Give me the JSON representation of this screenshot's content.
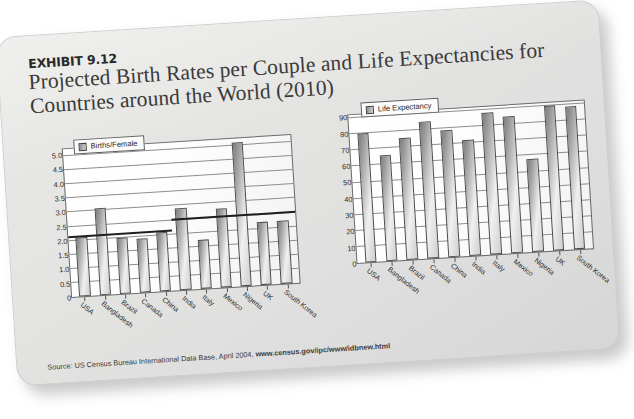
{
  "exhibit": {
    "label": "EXHIBIT 9.12",
    "title": "Projected Birth Rates per Couple and Life Expectancies for Countries around the World (2010)",
    "source_prefix": "Source: US Census Bureau International Data Base, April 2004,",
    "source_url": "www.census.gov/ipc/www/idbnew.html"
  },
  "chart_data": [
    {
      "type": "bar",
      "title": "",
      "legend": "Births/Female",
      "legend_position": "top-left-inside",
      "xlabel": "",
      "ylabel": "",
      "grid": true,
      "ylim": [
        0,
        5.25
      ],
      "yticks": [
        "0",
        "0.5",
        "1.0",
        "1.5",
        "2.0",
        "2.5",
        "3.0",
        "3.5",
        "4.0",
        "4.5",
        "5.0"
      ],
      "ytick_values": [
        0,
        0.5,
        1.0,
        1.5,
        2.0,
        2.5,
        3.0,
        3.5,
        4.0,
        4.5,
        5.0
      ],
      "reference_lines": [
        {
          "label": "left-segment",
          "value": 2.1,
          "from_index": 0,
          "to_index": 5
        },
        {
          "label": "right-segment",
          "value": 2.5,
          "from_index": 5,
          "to_index": 11
        }
      ],
      "categories": [
        "USA",
        "Bangladesh",
        "Brazil",
        "Canada",
        "China",
        "India",
        "Italy",
        "Mexico",
        "Nigeria",
        "UK",
        "South Korea"
      ],
      "values": [
        2.1,
        3.1,
        2.0,
        1.9,
        2.1,
        2.9,
        1.75,
        2.8,
        5.1,
        2.25,
        2.25
      ]
    },
    {
      "type": "bar",
      "title": "",
      "legend": "Life Expectancy",
      "legend_position": "top-left-inside",
      "xlabel": "",
      "ylabel": "",
      "grid": true,
      "ylim": [
        0,
        92
      ],
      "yticks": [
        "0",
        "10",
        "20",
        "30",
        "40",
        "50",
        "60",
        "70",
        "80",
        "90"
      ],
      "ytick_values": [
        0,
        10,
        20,
        30,
        40,
        50,
        60,
        70,
        80,
        90
      ],
      "reference_lines": [],
      "categories": [
        "USA",
        "Bangladesh",
        "Brazil",
        "Canada",
        "China",
        "India",
        "Italy",
        "Mexico",
        "Nigeria",
        "UK",
        "South Korea"
      ],
      "values": [
        80,
        66,
        76,
        85,
        79,
        72,
        88,
        85,
        58,
        90,
        89
      ]
    }
  ]
}
